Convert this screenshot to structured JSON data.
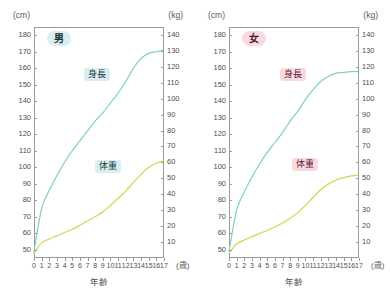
{
  "page": {
    "background": "#ffffff",
    "width": 390,
    "height": 302
  },
  "colors": {
    "height_curve": "#7fcfc4",
    "weight_curve": "#cdd84a",
    "axis": "#9a9a9a",
    "tick_text": "#4e4e4e",
    "badge_male_bg": "#d8eef0",
    "badge_female_bg": "#fad9e1"
  },
  "panels": [
    {
      "id": "male",
      "sex_badge": "男",
      "left_unit": "(cm)",
      "right_unit": "(kg)",
      "xlabel": "年齢",
      "xunit": "(歳)",
      "height_label": "身長",
      "weight_label": "体重",
      "chart_data": {
        "type": "line",
        "title": "男",
        "xlabel": "年齢",
        "ylabel": "(cm)",
        "y2label": "(kg)",
        "xlim": [
          0,
          17
        ],
        "ylim": [
          45,
          185
        ],
        "y2lim": [
          0,
          145
        ],
        "grid": false,
        "legend": "inline-annotations",
        "xticks": [
          0,
          1,
          2,
          3,
          4,
          5,
          6,
          7,
          8,
          9,
          10,
          11,
          12,
          13,
          14,
          15,
          16,
          17
        ],
        "yticks_left": [
          50,
          60,
          70,
          80,
          90,
          100,
          110,
          120,
          130,
          140,
          150,
          160,
          170,
          180
        ],
        "yticks_right": [
          10,
          20,
          30,
          40,
          50,
          60,
          70,
          80,
          90,
          100,
          110,
          120,
          130,
          140
        ],
        "x": [
          0,
          1,
          2,
          3,
          4,
          5,
          6,
          7,
          8,
          9,
          10,
          11,
          12,
          13,
          14,
          15,
          16,
          17
        ],
        "series": [
          {
            "name": "身長",
            "unit": "cm",
            "axis": "left",
            "color": "#7fcfc4",
            "values": [
              49,
              75,
              86,
              95,
              103,
              110,
              116,
              122,
              128,
              133,
              139,
              145,
              152,
              160,
              166,
              169,
              170,
              171
            ]
          },
          {
            "name": "体重",
            "unit": "kg",
            "axis": "right",
            "color": "#cdd84a",
            "values": [
              3.2,
              9.5,
              11.9,
              13.9,
              16.0,
              18.0,
              20.5,
              23.2,
              26.0,
              29.0,
              33.0,
              37.5,
              42.0,
              47.5,
              52.5,
              57.0,
              59.5,
              61.0
            ]
          }
        ]
      }
    },
    {
      "id": "female",
      "sex_badge": "女",
      "left_unit": "(cm)",
      "right_unit": "(kg)",
      "xlabel": "年齢",
      "xunit": "(歳)",
      "height_label": "身長",
      "weight_label": "体重",
      "chart_data": {
        "type": "line",
        "title": "女",
        "xlabel": "年齢",
        "ylabel": "(cm)",
        "y2label": "(kg)",
        "xlim": [
          0,
          17
        ],
        "ylim": [
          45,
          185
        ],
        "y2lim": [
          0,
          145
        ],
        "grid": false,
        "legend": "inline-annotations",
        "xticks": [
          0,
          1,
          2,
          3,
          4,
          5,
          6,
          7,
          8,
          9,
          10,
          11,
          12,
          13,
          14,
          15,
          16,
          17
        ],
        "yticks_left": [
          50,
          60,
          70,
          80,
          90,
          100,
          110,
          120,
          130,
          140,
          150,
          160,
          170,
          180
        ],
        "yticks_right": [
          10,
          20,
          30,
          40,
          50,
          60,
          70,
          80,
          90,
          100,
          110,
          120,
          130,
          140
        ],
        "x": [
          0,
          1,
          2,
          3,
          4,
          5,
          6,
          7,
          8,
          9,
          10,
          11,
          12,
          13,
          14,
          15,
          16,
          17
        ],
        "series": [
          {
            "name": "身長",
            "unit": "cm",
            "axis": "left",
            "color": "#7fcfc4",
            "values": [
              49,
              74,
              85,
              94,
              102,
              109,
              115,
              121,
              128,
              134,
              141,
              147,
              152,
              155,
              157,
              157.5,
              158,
              158
            ]
          },
          {
            "name": "体重",
            "unit": "kg",
            "axis": "right",
            "color": "#cdd84a",
            "values": [
              3.1,
              8.8,
              11.3,
              13.3,
              15.4,
              17.3,
              19.5,
              22.0,
              25.0,
              28.5,
              33.0,
              38.0,
              43.0,
              46.5,
              49.0,
              50.5,
              51.5,
              52.0
            ]
          }
        ]
      }
    }
  ]
}
